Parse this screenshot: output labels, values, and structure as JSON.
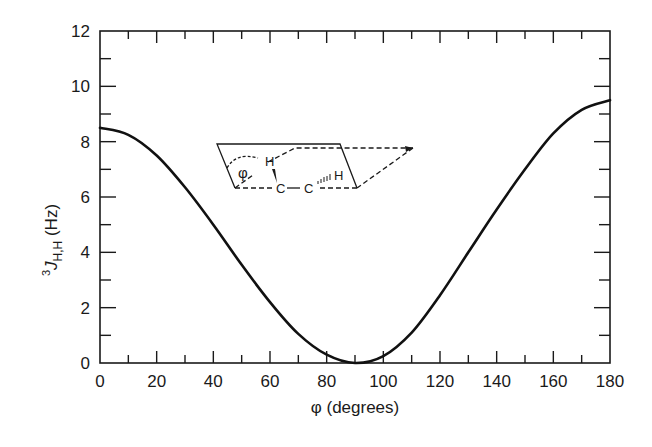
{
  "chart_data": {
    "type": "line",
    "title": "",
    "xlabel": "φ (degrees)",
    "ylabel": {
      "superscript": "3",
      "main": "J",
      "subscript": "H,H",
      "unit": " (Hz)"
    },
    "xlim": [
      0,
      180
    ],
    "ylim": [
      0,
      12
    ],
    "x_ticks": [
      0,
      20,
      40,
      60,
      80,
      100,
      120,
      140,
      160,
      180
    ],
    "x_tick_labels": [
      "0",
      "20",
      "40",
      "60",
      "80",
      "100",
      "120",
      "140",
      "160",
      "180"
    ],
    "y_ticks": [
      0,
      2,
      4,
      6,
      8,
      10,
      12
    ],
    "y_tick_labels": [
      "0",
      "2",
      "4",
      "6",
      "8",
      "10",
      "12"
    ],
    "grid": false,
    "legend": null,
    "series": [
      {
        "name": "Karplus curve",
        "x": [
          0,
          10,
          20,
          30,
          40,
          50,
          60,
          70,
          80,
          90,
          100,
          110,
          120,
          130,
          140,
          150,
          160,
          170,
          180
        ],
        "values": [
          8.5,
          8.25,
          7.5,
          6.35,
          5.0,
          3.55,
          2.2,
          1.05,
          0.3,
          0.0,
          0.25,
          1.1,
          2.45,
          4.0,
          5.55,
          7.0,
          8.3,
          9.15,
          9.5
        ]
      }
    ],
    "inset": {
      "description": "H-C-C-H dihedral angle diagram",
      "labels": {
        "phi": "φ",
        "h_left": "H",
        "h_right": "H",
        "c_left": "C",
        "c_right": "C"
      }
    }
  }
}
